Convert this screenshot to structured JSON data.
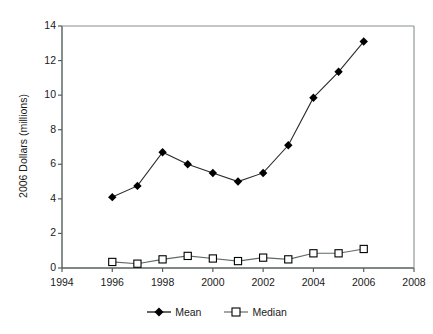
{
  "chart_data": {
    "type": "line",
    "title": "",
    "xlabel": "",
    "ylabel": "2006 Dollars (millions)",
    "xlim": [
      1994,
      2008
    ],
    "ylim": [
      0,
      14
    ],
    "xticks": [
      1994,
      1996,
      1998,
      2000,
      2002,
      2004,
      2006,
      2008
    ],
    "yticks": [
      0,
      2,
      4,
      6,
      8,
      10,
      12,
      14
    ],
    "grid": false,
    "legend_position": "bottom",
    "x": [
      1996,
      1997,
      1998,
      1999,
      2000,
      2001,
      2002,
      2003,
      2004,
      2005,
      2006
    ],
    "series": [
      {
        "name": "Mean",
        "marker": "filled-diamond",
        "color": "#000000",
        "values": [
          4.1,
          4.75,
          6.7,
          6.0,
          5.5,
          5.0,
          5.5,
          7.1,
          9.85,
          11.35,
          13.1
        ]
      },
      {
        "name": "Median",
        "marker": "open-square",
        "color": "#000000",
        "values": [
          0.35,
          0.25,
          0.5,
          0.7,
          0.55,
          0.4,
          0.6,
          0.5,
          0.85,
          0.85,
          1.1
        ]
      }
    ]
  },
  "legend": {
    "entries": [
      {
        "label": "Mean"
      },
      {
        "label": "Median"
      }
    ]
  },
  "axis": {
    "y_title": "2006 Dollars (millions)",
    "y_tick_labels": [
      "0",
      "2",
      "4",
      "6",
      "8",
      "10",
      "12",
      "14"
    ],
    "x_tick_labels": [
      "1994",
      "1996",
      "1998",
      "2000",
      "2002",
      "2004",
      "2006",
      "2008"
    ]
  }
}
